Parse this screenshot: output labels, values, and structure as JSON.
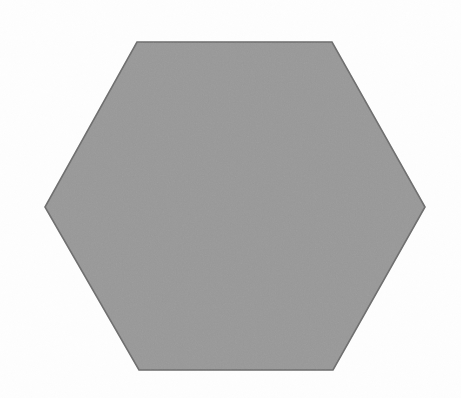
{
  "canvas": {
    "width": 461,
    "height": 398,
    "background_color": "#fefefe",
    "description": "Single gray hexagon centered on a plain white background"
  },
  "shape": {
    "name": "hexagon",
    "sides": 6,
    "orientation": "flat-top",
    "fill_color": "#9a9a9a",
    "stroke_color": "#6e6e6e",
    "stroke_width": 1.6,
    "texture": "fine-grain-noise",
    "center_x": 235,
    "center_y": 206,
    "width_px": 380,
    "height_px": 328,
    "vertices": [
      {
        "label": "top-left",
        "x": 137,
        "y": 42
      },
      {
        "label": "top-right",
        "x": 332,
        "y": 42
      },
      {
        "label": "right",
        "x": 425,
        "y": 207
      },
      {
        "label": "bottom-right",
        "x": 333,
        "y": 370
      },
      {
        "label": "bottom-left",
        "x": 139,
        "y": 370
      },
      {
        "label": "left",
        "x": 45,
        "y": 207
      }
    ],
    "points_attr": "137,42 332,42 425,207 333,370 139,370 45,207"
  },
  "chart_data": {
    "type": "scatter",
    "title": "",
    "subtitle": "",
    "xlabel": "",
    "ylabel": "",
    "grid": false,
    "legend": null,
    "xlim": [
      0,
      461
    ],
    "ylim": [
      0,
      398
    ],
    "annotations": [],
    "series": [
      {
        "name": "hexagon-outline",
        "kind": "polygon",
        "closed": true,
        "fill": "#9a9a9a",
        "stroke": "#6e6e6e",
        "x": [
          137,
          332,
          425,
          333,
          139,
          45
        ],
        "y": [
          42,
          42,
          207,
          370,
          370,
          207
        ]
      }
    ]
  }
}
